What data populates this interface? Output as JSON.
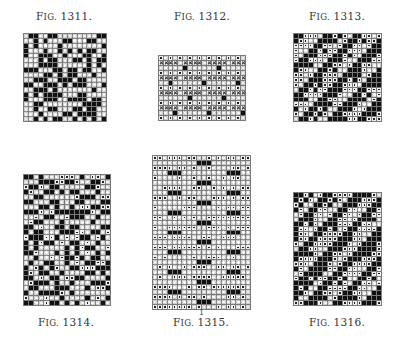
{
  "page": {
    "background": "#ffffff",
    "figures": [
      {
        "id": "fig-1311",
        "caption_prefix": "F",
        "caption_sc": "IG.",
        "caption_num": "1311.",
        "caption_pos": [
          14,
          10
        ],
        "caption_above": true,
        "grid": {
          "x": 23,
          "y": 33,
          "w": 84,
          "h": 89,
          "cols": 17,
          "rows": 18,
          "cell_types": [
            "b",
            "o"
          ],
          "pattern": "random-twill",
          "seed": 11
        }
      },
      {
        "id": "fig-1312",
        "caption_prefix": "F",
        "caption_sc": "IG.",
        "caption_num": "1312.",
        "caption_pos": [
          152,
          10
        ],
        "caption_above": true,
        "grid": {
          "x": 158,
          "y": 55,
          "w": 88,
          "h": 66,
          "cols": 18,
          "rows": 13,
          "cell_types": [
            "o",
            "d",
            "x",
            "b"
          ],
          "pattern": "cross-rows",
          "seed": 12
        }
      },
      {
        "id": "fig-1313",
        "caption_prefix": "F",
        "caption_sc": "IG.",
        "caption_num": "1313.",
        "caption_pos": [
          287,
          10
        ],
        "caption_above": true,
        "grid": {
          "x": 293,
          "y": 33,
          "w": 89,
          "h": 89,
          "cols": 18,
          "rows": 18,
          "cell_types": [
            "b",
            "d",
            "o"
          ],
          "pattern": "diagonal",
          "seed": 13
        }
      },
      {
        "id": "fig-1314",
        "caption_prefix": "F",
        "caption_sc": "IG.",
        "caption_num": "1314.",
        "caption_pos": [
          16,
          316
        ],
        "caption_above": false,
        "grid": {
          "x": 23,
          "y": 174,
          "w": 88,
          "h": 132,
          "cols": 17,
          "rows": 26,
          "cell_types": [
            "b",
            "d",
            "o"
          ],
          "pattern": "random-twill",
          "seed": 14
        }
      },
      {
        "id": "fig-1315",
        "caption_prefix": "F",
        "caption_sc": "IG.",
        "caption_num": "1315.",
        "caption_pos": [
          151,
          316
        ],
        "caption_above": false,
        "grid": {
          "x": 152,
          "y": 155,
          "w": 99,
          "h": 155,
          "cols": 20,
          "rows": 31,
          "cell_types": [
            "o",
            "d",
            "b"
          ],
          "pattern": "block-rows",
          "seed": 15
        }
      },
      {
        "id": "fig-1316",
        "caption_prefix": "F",
        "caption_sc": "IG.",
        "caption_num": "1316.",
        "caption_pos": [
          287,
          316
        ],
        "caption_above": false,
        "grid": {
          "x": 293,
          "y": 192,
          "w": 89,
          "h": 114,
          "cols": 18,
          "rows": 23,
          "cell_types": [
            "b",
            "d",
            "o"
          ],
          "pattern": "diagonal",
          "seed": 16
        }
      }
    ],
    "marks": [
      {
        "text": "1",
        "x": 199,
        "y": 308
      }
    ]
  }
}
